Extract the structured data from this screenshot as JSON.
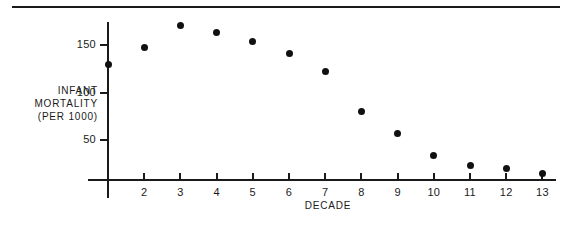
{
  "chart_data": {
    "type": "scatter",
    "title": "",
    "xlabel": "DECADE",
    "ylabel": "INFANT MORTALITY (PER 1000)",
    "ylabel_lines": [
      "INFANT",
      "MORTALITY",
      "(PER 1000)"
    ],
    "x": [
      1,
      2,
      3,
      4,
      5,
      6,
      7,
      8,
      9,
      10,
      11,
      12,
      13
    ],
    "values": [
      129,
      147,
      171,
      163,
      154,
      141,
      122,
      80,
      57,
      34,
      23,
      20,
      15
    ],
    "categories": [
      "1",
      "2",
      "3",
      "4",
      "5",
      "6",
      "7",
      "8",
      "9",
      "10",
      "11",
      "12",
      "13"
    ],
    "xtick_labels": [
      "",
      "2",
      "3",
      "4",
      "5",
      "6",
      "7",
      "8",
      "9",
      "10",
      "11",
      "12",
      "13"
    ],
    "ytick_labels": [
      "150",
      "100",
      "50"
    ],
    "ytick_values": [
      150,
      100,
      50
    ],
    "xlim": [
      0.5,
      13.6
    ],
    "ylim": [
      0,
      185
    ],
    "grid": false,
    "legend": false,
    "marker_color": "#111111",
    "axis_color": "#1a1a1a"
  },
  "figure": {
    "top_rule": true,
    "background": "#ffffff"
  }
}
